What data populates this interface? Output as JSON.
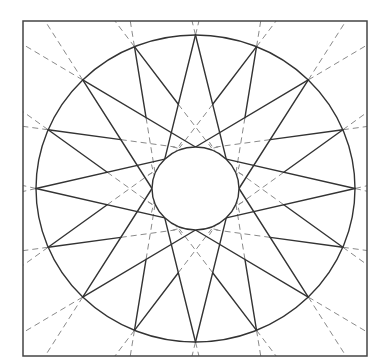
{
  "diagram": {
    "type": "mariners-compass-pattern",
    "canvas": {
      "width": 377,
      "height": 362,
      "background": "#ffffff"
    },
    "frame": {
      "x": 23,
      "y": 21,
      "width": 344,
      "height": 335,
      "stroke": "#444444",
      "stroke_width": 1.5
    },
    "center": {
      "x": 195.5,
      "y": 188.5
    },
    "outer_circle": {
      "rx": 159.5,
      "ry": 153.5,
      "stroke": "#333333",
      "stroke_width": 1.4
    },
    "inner_circle": {
      "rx": 43.5,
      "ry": 41.5,
      "stroke": "#333333",
      "stroke_width": 1.4,
      "fill": "#ffffff"
    },
    "star": {
      "point_count": 16,
      "major_points": 8,
      "minor_points": 8,
      "start_angle_deg": 0,
      "major_inner_offset_deg": 45,
      "stroke": "#333333",
      "stroke_width": 1.4
    },
    "construction_lines": {
      "style": "dashed",
      "stroke": "#8a8a8a",
      "stroke_width": 1,
      "dasharray": "6 4"
    }
  }
}
